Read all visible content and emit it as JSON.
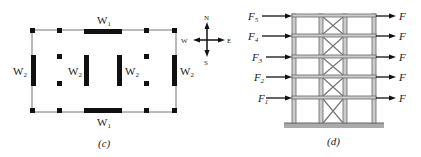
{
  "panel_c": {
    "caption": "(c)",
    "wall_labels": {
      "top": "W",
      "top_sub": "1",
      "bottom": "W",
      "bottom_sub": "1",
      "left": "W",
      "left_sub": "2",
      "inner_left": "W",
      "inner_left_sub": "2",
      "inner_right": "W",
      "inner_right_sub": "2",
      "right": "W",
      "right_sub": "2"
    },
    "compass": {
      "north": "N",
      "south": "S",
      "east": "E",
      "west": "W"
    }
  },
  "panel_d": {
    "caption": "(d)",
    "left_forces": [
      {
        "label": "F",
        "sub": "5"
      },
      {
        "label": "F",
        "sub": "4"
      },
      {
        "label": "F",
        "sub": "3"
      },
      {
        "label": "F",
        "sub": "2"
      },
      {
        "label": "F",
        "sub": "1"
      }
    ],
    "right_forces": [
      "F",
      "F",
      "F",
      "F",
      "F"
    ]
  }
}
